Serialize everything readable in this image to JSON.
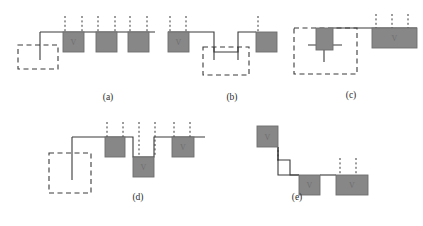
{
  "figure": {
    "width": 423,
    "height": 226,
    "background": "#ffffff",
    "block_fill": "#878787",
    "block_stroke": "#6d6d6d",
    "line_color": "#3a3a3a",
    "dash_color": "#3a3a3a",
    "label_color": "#2b2b2b",
    "panels": [
      {
        "id": "a",
        "label": "(a)",
        "label_x": 108,
        "label_y": 100,
        "dashed_box": {
          "x": 18,
          "y": 45,
          "w": 40,
          "h": 24
        },
        "stub_line": {
          "x": 40,
          "y1": 32,
          "y2": 60
        },
        "baseline": {
          "x1": 40,
          "y1": 32,
          "x2": 155,
          "y2": 32
        },
        "blocks": [
          {
            "x": 63,
            "y": 32,
            "w": 21,
            "h": 20,
            "mark": "V"
          },
          {
            "x": 96,
            "y": 32,
            "w": 21,
            "h": 20,
            "mark": ""
          },
          {
            "x": 128,
            "y": 32,
            "w": 21,
            "h": 20,
            "mark": ""
          }
        ],
        "ticks": [
          {
            "x": 65,
            "y1": 16,
            "y2": 32
          },
          {
            "x": 82,
            "y1": 16,
            "y2": 32
          },
          {
            "x": 98,
            "y1": 16,
            "y2": 32
          },
          {
            "x": 115,
            "y1": 16,
            "y2": 32
          },
          {
            "x": 130,
            "y1": 16,
            "y2": 32
          },
          {
            "x": 147,
            "y1": 16,
            "y2": 32
          }
        ]
      },
      {
        "id": "b",
        "label": "(b)",
        "label_x": 232,
        "label_y": 100,
        "dashed_box": {
          "x": 203,
          "y": 47,
          "w": 46,
          "h": 28
        },
        "blocks": [
          {
            "x": 168,
            "y": 32,
            "w": 21,
            "h": 20,
            "mark": "V"
          },
          {
            "x": 256,
            "y": 32,
            "w": 21,
            "h": 20,
            "mark": ""
          }
        ],
        "polyline": "168,32 168,32 189,32 214,32 214,52 238,52 238,32 256,32",
        "stubs": [
          {
            "x": 214,
            "y1": 47,
            "y2": 60
          },
          {
            "x": 238,
            "y1": 47,
            "y2": 60
          }
        ],
        "ticks": [
          {
            "x": 170,
            "y1": 16,
            "y2": 32
          },
          {
            "x": 186,
            "y1": 16,
            "y2": 32
          },
          {
            "x": 258,
            "y1": 16,
            "y2": 32
          }
        ]
      },
      {
        "id": "c",
        "label": "(c)",
        "label_x": 351,
        "label_y": 98,
        "dashed_box": {
          "x": 294,
          "y": 28,
          "w": 63,
          "h": 46
        },
        "blocks": [
          {
            "x": 316,
            "y": 28,
            "w": 17,
            "h": 22,
            "mark": ""
          },
          {
            "x": 372,
            "y": 28,
            "w": 45,
            "h": 20,
            "mark": "V"
          }
        ],
        "baseline": {
          "x1": 333,
          "y1": 28,
          "x2": 417,
          "y2": 28
        },
        "crossbar": {
          "x1": 308,
          "y1": 45,
          "x2": 342,
          "y2": 45
        },
        "stub_line": {
          "x": 324,
          "y1": 45,
          "y2": 62
        },
        "ticks": [
          {
            "x": 376,
            "y1": 14,
            "y2": 28
          },
          {
            "x": 392,
            "y1": 14,
            "y2": 28
          },
          {
            "x": 408,
            "y1": 14,
            "y2": 28
          }
        ]
      },
      {
        "id": "d",
        "label": "(d)",
        "label_x": 138,
        "label_y": 200,
        "dashed_box": {
          "x": 49,
          "y": 153,
          "w": 42,
          "h": 40
        },
        "stub_line": {
          "x": 72,
          "y1": 137,
          "y2": 180
        },
        "baseline_left": {
          "x1": 72,
          "y1": 137,
          "x2": 105,
          "y2": 137
        },
        "polyline": "105,137 105,137 133,137 133,157 154,157 154,137 205,137",
        "blocks": [
          {
            "x": 105,
            "y": 137,
            "w": 20,
            "h": 20,
            "mark": ""
          },
          {
            "x": 133,
            "y": 157,
            "w": 21,
            "h": 20,
            "mark": "V"
          },
          {
            "x": 172,
            "y": 137,
            "w": 22,
            "h": 20,
            "mark": "V"
          }
        ],
        "ticks": [
          {
            "x": 107,
            "y1": 122,
            "y2": 137
          },
          {
            "x": 123,
            "y1": 122,
            "y2": 137
          },
          {
            "x": 139,
            "y1": 122,
            "y2": 157
          },
          {
            "x": 155,
            "y1": 122,
            "y2": 157
          },
          {
            "x": 174,
            "y1": 122,
            "y2": 137
          },
          {
            "x": 190,
            "y1": 122,
            "y2": 137
          }
        ]
      },
      {
        "id": "e",
        "label": "(e)",
        "label_x": 297,
        "label_y": 200,
        "blocks": [
          {
            "x": 257,
            "y": 126,
            "w": 21,
            "h": 21,
            "mark": "V"
          },
          {
            "x": 299,
            "y": 175,
            "w": 21,
            "h": 20,
            "mark": "V"
          },
          {
            "x": 336,
            "y": 175,
            "w": 32,
            "h": 20,
            "mark": "V"
          }
        ],
        "polyline": "278,147 278,147 278,160 278,175 299,175",
        "stairs": "278,147 278,160 290,160 290,175 299,175",
        "baseline_right": {
          "x1": 320,
          "y1": 175,
          "x2": 336,
          "y2": 175
        },
        "ticks": [
          {
            "x": 278,
            "y1": 150,
            "y2": 162
          },
          {
            "x": 340,
            "y1": 158,
            "y2": 175
          },
          {
            "x": 356,
            "y1": 158,
            "y2": 175
          }
        ]
      }
    ]
  }
}
